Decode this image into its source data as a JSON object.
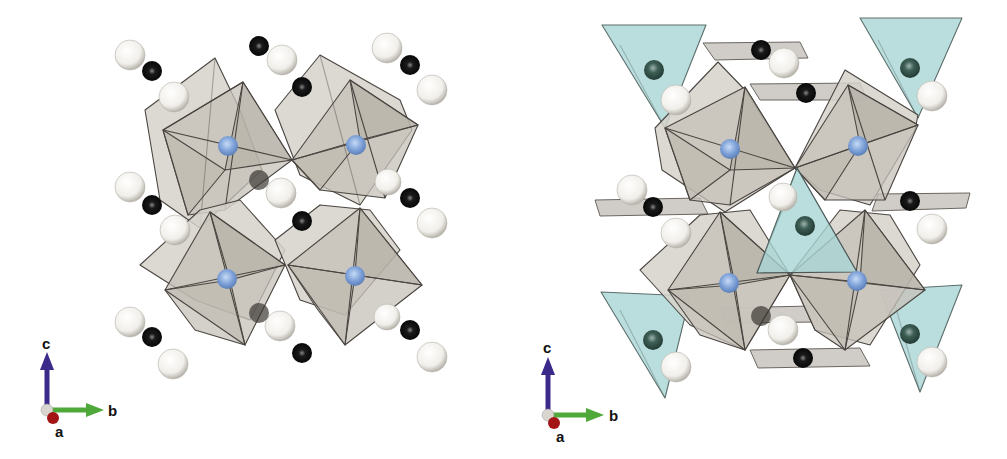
{
  "figure": {
    "type": "crystal-structure-comparison",
    "panels": [
      {
        "id": "left",
        "description": "Framework of corner-sharing grey octahedra with blue central atoms; isolated black-white atom pairs between octahedra",
        "axes": {
          "c": "c",
          "b": "b",
          "a": "a"
        },
        "polyhedra": {
          "octahedra_count": 4,
          "octahedron_color": "#c9c4bd",
          "triangles_count": 0
        },
        "atoms": {
          "blue_centers": 4,
          "black_small": 10,
          "white_large": 14
        }
      },
      {
        "id": "right",
        "description": "Same octahedral framework with additional teal triangular units and grey planar groups",
        "axes": {
          "c": "c",
          "b": "b",
          "a": "a"
        },
        "polyhedra": {
          "octahedra_count": 4,
          "octahedron_color": "#c9c4bd",
          "teal_triangles_count": 5,
          "teal_color": "#a9d6d6",
          "planar_groups_count": 5
        },
        "atoms": {
          "blue_centers": 4,
          "dark_green_centers": 5,
          "black_small": 5,
          "white_large": 12
        }
      }
    ]
  },
  "legend_axes": {
    "c_label": "c",
    "b_label": "b",
    "a_label": "a",
    "c_color": "#3c2a8a",
    "b_color": "#4fa83a",
    "a_color": "#a31515"
  },
  "colors": {
    "octahedron_fill": "#c9c4bd",
    "octahedron_edge": "#4a4540",
    "blue_atom": "#7da0d8",
    "black_atom": "#141414",
    "white_atom": "#f4f2ee",
    "teal_fill": "#a9d6d6",
    "dark_green_atom": "#3a5a52"
  }
}
